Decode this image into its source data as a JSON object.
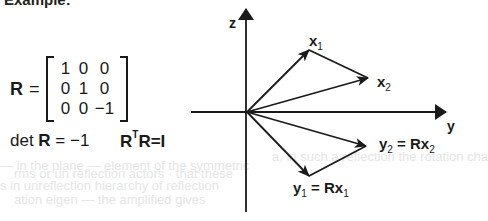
{
  "heading": "Example:",
  "matrix": {
    "symbol": "R",
    "equals": "=",
    "rows": [
      [
        "1",
        "0",
        "0"
      ],
      [
        "0",
        "1",
        "0"
      ],
      [
        "0",
        "0",
        "−1"
      ]
    ]
  },
  "determinant": {
    "prefix": "det ",
    "symbol": "R",
    "rest": " = −1"
  },
  "orthogonality": {
    "r1": "R",
    "sup": "T",
    "r2": "R",
    "rest": "=I"
  },
  "axes": {
    "z_label": "z",
    "y_label": "y"
  },
  "vectors": {
    "x1": {
      "base": "x",
      "sub": "1"
    },
    "x2": {
      "base": "x",
      "sub": "2"
    },
    "y1": {
      "base": "y",
      "sub": "1",
      "eq": " = Rx",
      "eq_sub": "1"
    },
    "y2": {
      "base": "y",
      "sub": "2",
      "eq": " = Rx",
      "eq_sub": "2"
    }
  },
  "colors": {
    "ink": "#1a1a1a",
    "bleed_through": "#e6e6e6"
  }
}
